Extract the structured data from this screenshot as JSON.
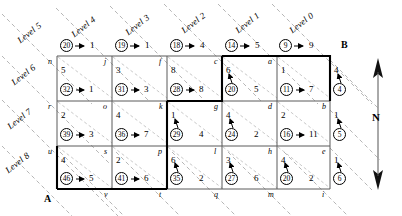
{
  "figure": {
    "corner_labels": [
      {
        "name": "B",
        "text": "B"
      },
      {
        "name": "A",
        "text": "A"
      }
    ],
    "compass": {
      "label": "N"
    }
  },
  "levels": [
    {
      "label": "Level 5"
    },
    {
      "label": "Level 4"
    },
    {
      "label": "Level 3"
    },
    {
      "label": "Level 2"
    },
    {
      "label": "Level 1"
    },
    {
      "label": "Level 0"
    },
    {
      "label": "Level 6"
    },
    {
      "label": "Level 7"
    },
    {
      "label": "Level 8"
    }
  ],
  "top_row": [
    {
      "circle": "20",
      "arrow": "right",
      "weight": "1"
    },
    {
      "circle": "19",
      "arrow": "right",
      "weight": "1"
    },
    {
      "circle": "18",
      "arrow": "right",
      "weight": "4"
    },
    {
      "circle": "14",
      "arrow": "right",
      "weight": "5"
    },
    {
      "circle": "9",
      "arrow": "right",
      "weight": "9"
    }
  ],
  "right_col": [
    {
      "top": "4",
      "circle": "4",
      "arrow": "up"
    },
    {
      "top": "1",
      "circle": "5",
      "arrow": "up"
    },
    {
      "top": "1",
      "circle": "6",
      "arrow": "up"
    }
  ],
  "cells": [
    {
      "node": "n",
      "top": "5",
      "circle": "32",
      "arrow": "right",
      "side": "1",
      "row": 0,
      "col": 0
    },
    {
      "node": "j",
      "top": "3",
      "circle": "31",
      "arrow": "right",
      "side": "3",
      "row": 0,
      "col": 1
    },
    {
      "node": "f",
      "top": "8",
      "circle": "28",
      "arrow": "right",
      "side": "8",
      "row": 0,
      "col": 2
    },
    {
      "node": "c",
      "top": "6",
      "circle": "20",
      "arrow": "up",
      "side": "5",
      "row": 0,
      "col": 3
    },
    {
      "node": "a",
      "top": "1",
      "circle": "11",
      "arrow": "right",
      "side": "7",
      "row": 0,
      "col": 4
    },
    {
      "node": "r",
      "top": "2",
      "circle": "39",
      "arrow": "right",
      "side": "3",
      "row": 1,
      "col": 0
    },
    {
      "node": "o",
      "top": "4",
      "circle": "36",
      "arrow": "right",
      "side": "7",
      "row": 1,
      "col": 1
    },
    {
      "node": "k",
      "top": "1",
      "circle": "29",
      "arrow": "up",
      "side": "4",
      "row": 1,
      "col": 2
    },
    {
      "node": "g",
      "top": "4",
      "circle": "24",
      "arrow": "up",
      "side": "2",
      "row": 1,
      "col": 3
    },
    {
      "node": "d",
      "top": "2",
      "circle": "16",
      "arrow": "right",
      "side": "11",
      "row": 1,
      "col": 4
    },
    {
      "node": "u",
      "top": "4",
      "circle": "46",
      "arrow": "right",
      "side": "5",
      "row": 2,
      "col": 0
    },
    {
      "node": "s",
      "top": "2",
      "circle": "41",
      "arrow": "right",
      "side": "6",
      "row": 2,
      "col": 1
    },
    {
      "node": "p",
      "top": "6",
      "circle": "35",
      "arrow": "up",
      "side": "2",
      "row": 2,
      "col": 2
    },
    {
      "node": "l",
      "top": "3",
      "circle": "27",
      "arrow": "up",
      "side": "6",
      "row": 2,
      "col": 3
    },
    {
      "node": "h",
      "top": "4",
      "circle": "20",
      "arrow": "up",
      "side": "2",
      "row": 2,
      "col": 4
    }
  ],
  "right_nodes": [
    {
      "label": "b"
    },
    {
      "label": "e"
    }
  ],
  "bottom_nodes": [
    {
      "label": "v"
    },
    {
      "label": "t"
    },
    {
      "label": "q"
    },
    {
      "label": "m"
    },
    {
      "label": "i"
    }
  ],
  "colors": {
    "ink": "#000000",
    "grid": "#6b6b6b",
    "dash": "#9a9a9a",
    "paper": "#ffffff"
  }
}
